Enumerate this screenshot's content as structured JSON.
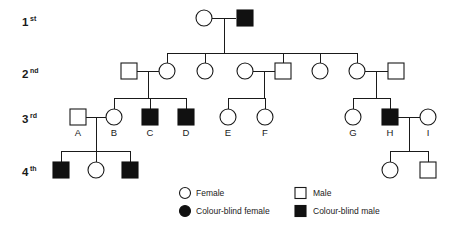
{
  "figure": {
    "type": "pedigree-chart",
    "topic": "Colour blindness inheritance pedigree",
    "width": 463,
    "height": 230,
    "background_color": "#ffffff",
    "line_color": "#1a1a1a",
    "filled_color": "#111111"
  },
  "generations": [
    {
      "key": "g1",
      "number": "1",
      "suffix": "st",
      "label": "1st",
      "y": 22
    },
    {
      "key": "g2",
      "number": "2",
      "suffix": "nd",
      "label": "2nd",
      "y": 74
    },
    {
      "key": "g3",
      "number": "3",
      "suffix": "rd",
      "label": "3rd",
      "y": 119
    },
    {
      "key": "g4",
      "number": "4",
      "suffix": "th",
      "label": "4th",
      "y": 172
    }
  ],
  "individuals": [
    {
      "id": "g1-f1",
      "generation": 1,
      "sex": "female",
      "affected": false,
      "symbol": "open-circle",
      "label": "",
      "cx": 204,
      "cy": 18
    },
    {
      "id": "g1-m1",
      "generation": 1,
      "sex": "male",
      "affected": true,
      "symbol": "filled-square",
      "label": "",
      "cx": 245,
      "cy": 18
    },
    {
      "id": "g2-m-spouse-left",
      "generation": 2,
      "sex": "male",
      "affected": false,
      "symbol": "open-square",
      "label": "",
      "cx": 129,
      "cy": 71
    },
    {
      "id": "g2-f-child1",
      "generation": 2,
      "sex": "female",
      "affected": false,
      "symbol": "open-circle",
      "label": "",
      "cx": 167,
      "cy": 71
    },
    {
      "id": "g2-f-child2",
      "generation": 2,
      "sex": "female",
      "affected": false,
      "symbol": "open-circle",
      "label": "",
      "cx": 205,
      "cy": 71
    },
    {
      "id": "g2-f-spouse-mid",
      "generation": 2,
      "sex": "female",
      "affected": false,
      "symbol": "open-circle",
      "label": "",
      "cx": 245,
      "cy": 71
    },
    {
      "id": "g2-m-child3",
      "generation": 2,
      "sex": "male",
      "affected": false,
      "symbol": "open-square",
      "label": "",
      "cx": 283,
      "cy": 71
    },
    {
      "id": "g2-f-child4",
      "generation": 2,
      "sex": "female",
      "affected": false,
      "symbol": "open-circle",
      "label": "",
      "cx": 320,
      "cy": 71
    },
    {
      "id": "g2-f-child5",
      "generation": 2,
      "sex": "female",
      "affected": false,
      "symbol": "open-circle",
      "label": "",
      "cx": 357,
      "cy": 71
    },
    {
      "id": "g2-m-spouse-right",
      "generation": 2,
      "sex": "male",
      "affected": false,
      "symbol": "open-square",
      "label": "",
      "cx": 396,
      "cy": 71
    },
    {
      "id": "g3-A",
      "generation": 3,
      "sex": "male",
      "affected": false,
      "symbol": "open-square",
      "label": "A",
      "cx": 78,
      "cy": 117
    },
    {
      "id": "g3-B",
      "generation": 3,
      "sex": "female",
      "affected": false,
      "symbol": "open-circle",
      "label": "B",
      "cx": 114,
      "cy": 117
    },
    {
      "id": "g3-C",
      "generation": 3,
      "sex": "male",
      "affected": true,
      "symbol": "filled-square",
      "label": "C",
      "cx": 150,
      "cy": 117
    },
    {
      "id": "g3-D",
      "generation": 3,
      "sex": "male",
      "affected": true,
      "symbol": "filled-square",
      "label": "D",
      "cx": 186,
      "cy": 117
    },
    {
      "id": "g3-E",
      "generation": 3,
      "sex": "female",
      "affected": false,
      "symbol": "open-circle",
      "label": "E",
      "cx": 228,
      "cy": 117
    },
    {
      "id": "g3-F",
      "generation": 3,
      "sex": "female",
      "affected": false,
      "symbol": "open-circle",
      "label": "F",
      "cx": 265,
      "cy": 117
    },
    {
      "id": "g3-G",
      "generation": 3,
      "sex": "female",
      "affected": false,
      "symbol": "open-circle",
      "label": "G",
      "cx": 353,
      "cy": 117
    },
    {
      "id": "g3-H",
      "generation": 3,
      "sex": "male",
      "affected": true,
      "symbol": "filled-square",
      "label": "H",
      "cx": 390,
      "cy": 117
    },
    {
      "id": "g3-I",
      "generation": 3,
      "sex": "female",
      "affected": false,
      "symbol": "open-circle",
      "label": "I",
      "cx": 428,
      "cy": 117
    },
    {
      "id": "g4-m1",
      "generation": 4,
      "sex": "male",
      "affected": true,
      "symbol": "filled-square",
      "label": "",
      "cx": 61,
      "cy": 170
    },
    {
      "id": "g4-f1",
      "generation": 4,
      "sex": "female",
      "affected": false,
      "symbol": "open-circle",
      "label": "",
      "cx": 96,
      "cy": 170
    },
    {
      "id": "g4-m2",
      "generation": 4,
      "sex": "male",
      "affected": true,
      "symbol": "filled-square",
      "label": "",
      "cx": 130,
      "cy": 170
    },
    {
      "id": "g4-f2",
      "generation": 4,
      "sex": "female",
      "affected": false,
      "symbol": "open-circle",
      "label": "",
      "cx": 390,
      "cy": 170
    },
    {
      "id": "g4-m3",
      "generation": 4,
      "sex": "male",
      "affected": false,
      "symbol": "open-square",
      "label": "",
      "cx": 428,
      "cy": 170
    }
  ],
  "legend": {
    "items": [
      {
        "key": "female",
        "symbol": "open-circle",
        "label": "Female",
        "column": 1,
        "row": 1
      },
      {
        "key": "colour-blind-female",
        "symbol": "filled-circle",
        "label": "Colour-blind female",
        "column": 1,
        "row": 2
      },
      {
        "key": "male",
        "symbol": "open-square",
        "label": "Male",
        "column": 2,
        "row": 1
      },
      {
        "key": "colour-blind-male",
        "symbol": "filled-square",
        "label": "Colour-blind male",
        "column": 2,
        "row": 2
      }
    ]
  }
}
